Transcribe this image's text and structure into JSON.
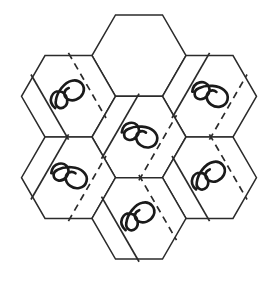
{
  "figure": {
    "title": "Hexagonal rosette net diagram",
    "canvas": {
      "width": 278,
      "height": 284,
      "background": "#ffffff"
    },
    "geometry": {
      "layout": "hexagonal-rosette",
      "hex_count": 7,
      "hex_orientation": "flat-top",
      "hex_radius": 47,
      "center_x": 139,
      "center_y": 137,
      "column_step_x": 70.5,
      "row_step_y": 81.4
    },
    "style": {
      "outline_color": "#2b2b2b",
      "outline_width": 1.5,
      "fold_solid_color": "#2b2b2b",
      "fold_dashed_color": "#2b2b2b",
      "dash_pattern": "7 5",
      "squiggle_color": "#1a1a1a",
      "squiggle_width": 2.6,
      "fill_color": "#ffffff"
    },
    "cells": [
      {
        "id": "hex-top",
        "label": "Top hexagon",
        "position": "top",
        "cx": 139,
        "cy": 55.6,
        "has_squiggle": false,
        "has_solid_fold": false,
        "has_dashed_fold": false,
        "fold_arrangement": "none"
      },
      {
        "id": "hex-top-left",
        "label": "Top-left hexagon",
        "position": "top-left",
        "cx": 68.5,
        "cy": 96.3,
        "has_squiggle": true,
        "has_solid_fold": true,
        "has_dashed_fold": true,
        "fold_arrangement": "dashed-left-solid-right",
        "fold_angle_deg": 60
      },
      {
        "id": "hex-top-right",
        "label": "Top-right hexagon",
        "position": "top-right",
        "cx": 209.5,
        "cy": 96.3,
        "has_squiggle": true,
        "has_solid_fold": true,
        "has_dashed_fold": true,
        "fold_arrangement": "solid-left-dashed-right",
        "fold_angle_deg": -60
      },
      {
        "id": "hex-center",
        "label": "Center hexagon",
        "position": "center",
        "cx": 139,
        "cy": 137,
        "has_squiggle": true,
        "has_solid_fold": true,
        "has_dashed_fold": true,
        "fold_arrangement": "solid-left-dashed-right",
        "fold_angle_deg": -60
      },
      {
        "id": "hex-bottom-left",
        "label": "Bottom-left hexagon",
        "position": "bottom-left",
        "cx": 68.5,
        "cy": 177.7,
        "has_squiggle": true,
        "has_solid_fold": true,
        "has_dashed_fold": true,
        "fold_arrangement": "solid-left-dashed-right",
        "fold_angle_deg": -60
      },
      {
        "id": "hex-bottom-right",
        "label": "Bottom-right hexagon",
        "position": "bottom-right",
        "cx": 209.5,
        "cy": 177.7,
        "has_squiggle": true,
        "has_solid_fold": true,
        "has_dashed_fold": true,
        "fold_arrangement": "dashed-left-solid-right",
        "fold_angle_deg": 60
      },
      {
        "id": "hex-bottom",
        "label": "Bottom hexagon",
        "position": "bottom",
        "cx": 139,
        "cy": 218.4,
        "has_squiggle": true,
        "has_solid_fold": true,
        "has_dashed_fold": true,
        "fold_arrangement": "dashed-left-solid-right",
        "fold_angle_deg": 60
      }
    ]
  }
}
